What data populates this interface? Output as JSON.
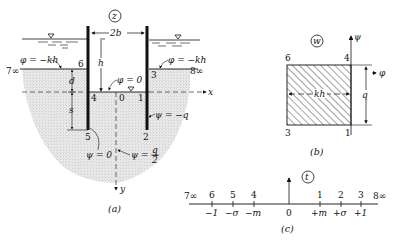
{
  "figure_a": {
    "plane_label": "z",
    "caption": "(a)",
    "width_label": "2b",
    "height_label": "h",
    "d_label": "d",
    "s_label": "s",
    "phi_left": "φ = −kh",
    "phi_right": "φ = −kh",
    "phi_zero": "φ = 0",
    "psi_minus_q": "ψ = −q",
    "psi_zero": "ψ = 0",
    "psi_half_q": "ψ = −",
    "psi_half_num": "q",
    "psi_half_den": "2",
    "x_axis": "x",
    "y_axis": "y",
    "points": {
      "p0": "0",
      "p1": "1",
      "p2": "2",
      "p3": "3",
      "p4": "4",
      "p5": "5",
      "p6": "6",
      "p7": "7∞",
      "p8": "8∞"
    }
  },
  "figure_b": {
    "plane_label": "w",
    "caption": "(b)",
    "psi_axis": "ψ",
    "phi_axis": "φ",
    "width_label": "kh",
    "height_label": "q",
    "corners": {
      "top_left": "6",
      "top_right": "4",
      "bottom_left": "3",
      "bottom_right": "1"
    }
  },
  "figure_c": {
    "plane_label": "t",
    "caption": "(c)",
    "points_above": [
      "7∞",
      "6",
      "5",
      "4",
      "1",
      "2",
      "3",
      "8∞"
    ],
    "values_below": [
      "−1",
      "−σ",
      "−m",
      "0",
      "+m",
      "+σ",
      "+1"
    ]
  }
}
